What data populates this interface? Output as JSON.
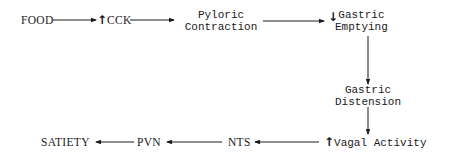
{
  "diagram": {
    "nodes": {
      "food": {
        "label": "FOOD"
      },
      "cck": {
        "label": "CCK",
        "modifier": "increase",
        "modifier_glyph": "↑"
      },
      "pyloric_contraction": {
        "line1": "Pyloric",
        "line2": "Contraction"
      },
      "gastric_emptying": {
        "line1": "Gastric",
        "line2": "Emptying",
        "modifier": "decrease",
        "modifier_glyph": "↓"
      },
      "gastric_distension": {
        "line1": "Gastric",
        "line2": "Distension"
      },
      "vagal_activity": {
        "label": "Vagal Activity",
        "modifier": "increase",
        "modifier_glyph": "↑"
      },
      "nts": {
        "label": "NTS"
      },
      "pvn": {
        "label": "PVN"
      },
      "satiety": {
        "label": "SATIETY"
      }
    },
    "edges": [
      {
        "from": "FOOD",
        "to": "CCK"
      },
      {
        "from": "CCK",
        "to": "Pyloric Contraction"
      },
      {
        "from": "Pyloric Contraction",
        "to": "Gastric Emptying"
      },
      {
        "from": "Gastric Emptying",
        "to": "Gastric Distension"
      },
      {
        "from": "Gastric Distension",
        "to": "Vagal Activity"
      },
      {
        "from": "Vagal Activity",
        "to": "NTS"
      },
      {
        "from": "NTS",
        "to": "PVN"
      },
      {
        "from": "PVN",
        "to": "SATIETY"
      }
    ],
    "colors": {
      "ink": "#1a1a1a",
      "background": "#ffffff"
    }
  }
}
